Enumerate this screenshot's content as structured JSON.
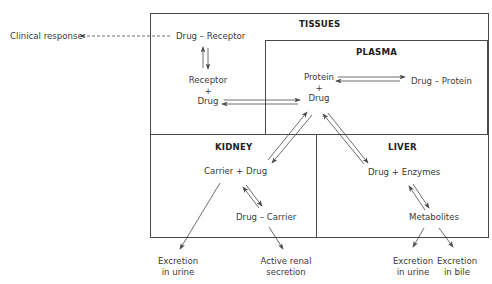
{
  "compartments": {
    "tissues": "TISSUES",
    "plasma": "PLASMA",
    "kidney": "KIDNEY",
    "liver": "LIVER"
  },
  "nodes": {
    "clinical_response": "Clinical response",
    "drug_receptor": "Drug – Receptor",
    "receptor": "Receptor",
    "receptor_plus": "+",
    "receptor_drug": "Drug",
    "protein": "Protein",
    "protein_plus": "+",
    "plasma_drug": "Drug",
    "drug_protein": "Drug – Protein",
    "carrier_drug": "Carrier + Drug",
    "drug_carrier": "Drug – Carrier",
    "drug_enzymes": "Drug + Enzymes",
    "metabolites": "Metabolites",
    "kidney_excretion_urine_1": "Excretion",
    "kidney_excretion_urine_2": "in urine",
    "active_renal_1": "Active renal",
    "active_renal_2": "secretion",
    "liver_excretion_urine_1": "Excretion",
    "liver_excretion_urine_2": "in urine",
    "excretion_bile_1": "Excretion",
    "excretion_bile_2": "in bile"
  },
  "colors": {
    "line": "#4a4a4a",
    "text": "#3a3a3a"
  }
}
